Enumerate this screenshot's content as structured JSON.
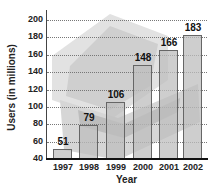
{
  "chart_data": {
    "type": "bar",
    "title": "",
    "xlabel": "Year",
    "ylabel": "Users (in millions)",
    "categories": [
      "1997",
      "1998",
      "1999",
      "2000",
      "2001",
      "2002"
    ],
    "values": [
      51,
      79,
      106,
      148,
      166,
      183
    ],
    "data_labels": [
      "51",
      "79",
      "106",
      "148",
      "166",
      "183"
    ],
    "ylim": [
      40,
      200
    ],
    "yticks": [
      "40",
      "60",
      "80",
      "100",
      "120",
      "140",
      "160",
      "180",
      "200"
    ],
    "grid": true,
    "legend": null,
    "background_image": "laptop-photo"
  }
}
